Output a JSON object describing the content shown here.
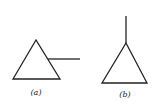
{
  "figure": {
    "panels": [
      {
        "id": "a",
        "label": "(a)",
        "description": "Triangle with horizontal line extending from its right side",
        "triangle": {
          "apex": [
            36,
            40
          ],
          "base_left": [
            13,
            79
          ],
          "base_right": [
            60,
            79
          ]
        },
        "tail": {
          "from": [
            48,
            59
          ],
          "to": [
            80,
            59
          ]
        },
        "label_pos": [
          36,
          95
        ]
      },
      {
        "id": "b",
        "label": "(b)",
        "description": "Triangle with vertical line extending upward from its apex",
        "triangle": {
          "apex": [
            126,
            43
          ],
          "base_left": [
            102,
            83
          ],
          "base_right": [
            147,
            83
          ]
        },
        "tail": {
          "from": [
            126,
            43
          ],
          "to": [
            126,
            16
          ]
        },
        "label_pos": [
          125,
          97
        ]
      }
    ],
    "stroke_color": "#222222",
    "background": "#ffffff"
  }
}
